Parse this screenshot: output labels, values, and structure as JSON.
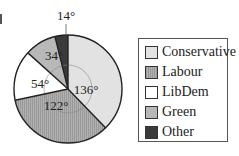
{
  "chart_data": {
    "type": "pie",
    "title": "",
    "categories": [
      "Conservative",
      "Labour",
      "LibDem",
      "Green",
      "Other"
    ],
    "values": [
      136,
      122,
      54,
      34,
      14
    ],
    "unit": "degrees",
    "slice_labels": [
      "136°",
      "122°",
      "54°",
      "34°",
      "14°"
    ],
    "colors": [
      "#e2e2e2",
      "#acacac",
      "#ffffff",
      "#b8b8b8",
      "#3a3a3a"
    ],
    "patterns": [
      "none",
      "vertical-hatch",
      "none",
      "none",
      "none"
    ],
    "start_angle": "12 o'clock",
    "direction": "clockwise",
    "legend_position": "right"
  },
  "legend": {
    "items": [
      {
        "label": "Conservative",
        "color": "#e2e2e2"
      },
      {
        "label": "Labour",
        "color": "#acacac"
      },
      {
        "label": "LibDem",
        "color": "#ffffff"
      },
      {
        "label": "Green",
        "color": "#b8b8b8"
      },
      {
        "label": "Other",
        "color": "#3a3a3a"
      }
    ]
  }
}
